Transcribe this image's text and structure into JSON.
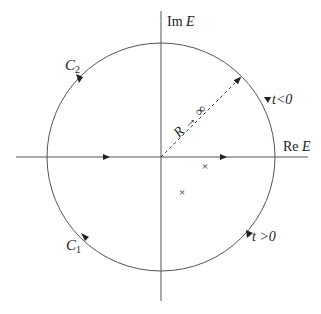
{
  "diagram": {
    "type": "complex-plane contour diagram",
    "axes": {
      "x_label_prefix": "Re",
      "x_label_var": "E",
      "y_label_prefix": "Im",
      "y_label_var": "E"
    },
    "contours": [
      {
        "name": "C",
        "subscript": "1",
        "region": "lower half-plane"
      },
      {
        "name": "C",
        "subscript": "2",
        "region": "upper half-plane"
      }
    ],
    "radius_label": "R → ∞",
    "conditions": {
      "upper": "t<0",
      "lower": "t >0"
    },
    "poles": [
      {
        "marker": "×",
        "x": 205,
        "y": 166
      },
      {
        "marker": "×",
        "x": 182,
        "y": 192
      }
    ],
    "colors": {
      "line": "#555555",
      "text": "#222222",
      "background": "#ffffff"
    }
  }
}
